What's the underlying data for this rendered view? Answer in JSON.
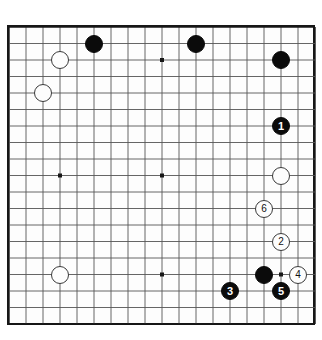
{
  "figure": {
    "name": "go-board-diagram",
    "board_size": 19,
    "visible_grid_lines": 19,
    "background_color": "#ffffff",
    "board_color": "#fdfdfd",
    "border_color": "#171717",
    "grid_line_color": "#555555",
    "black_stone_color": "#0b0b0b",
    "white_stone_color": "#fdfdfd",
    "white_stone_border_color": "#3a3a3a",
    "black_label_color": "#ffffff",
    "white_label_color": "#111111"
  },
  "geometry": {
    "origin_x": 9,
    "origin_y": 27,
    "step_x": 17,
    "step_y": 16.5,
    "columns": 18,
    "rows": 18,
    "stone_diameter": 18,
    "numbered_stone_diameter": 18,
    "star_point_radius": 2
  },
  "star_points": [
    {
      "name": "star-point-upper-left",
      "col": 3,
      "row": 2
    },
    {
      "name": "star-point-upper-center",
      "col": 9,
      "row": 2
    },
    {
      "name": "star-point-upper-right",
      "col": 16,
      "row": 2
    },
    {
      "name": "star-point-middle-left",
      "col": 3,
      "row": 9
    },
    {
      "name": "star-point-center",
      "col": 9,
      "row": 9
    },
    {
      "name": "star-point-middle-right",
      "col": 16,
      "row": 9
    },
    {
      "name": "star-point-lower-left",
      "col": 3,
      "row": 15
    },
    {
      "name": "star-point-lower-center",
      "col": 9,
      "row": 15
    },
    {
      "name": "star-point-lower-right",
      "col": 16,
      "row": 15
    }
  ],
  "stones": [
    {
      "name": "black-stone-upper-left-area",
      "color": "black",
      "label": "",
      "col": 5,
      "row": 1
    },
    {
      "name": "black-stone-upper-center",
      "color": "black",
      "label": "",
      "col": 11,
      "row": 1
    },
    {
      "name": "black-stone-upper-right",
      "color": "black",
      "label": "",
      "col": 16,
      "row": 2
    },
    {
      "name": "white-stone-upper-left-high",
      "color": "white",
      "label": "",
      "col": 3,
      "row": 2
    },
    {
      "name": "white-stone-upper-left-low",
      "color": "white",
      "label": "",
      "col": 2,
      "row": 4
    },
    {
      "name": "white-stone-right-side",
      "color": "white",
      "label": "",
      "col": 16,
      "row": 9
    },
    {
      "name": "white-stone-lower-left",
      "color": "white",
      "label": "",
      "col": 3,
      "row": 15
    },
    {
      "name": "black-stone-lower-right",
      "color": "black",
      "label": "",
      "col": 15,
      "row": 15
    },
    {
      "name": "numbered-stone-1",
      "color": "black",
      "label": "1",
      "col": 16,
      "row": 6
    },
    {
      "name": "numbered-stone-6",
      "color": "white",
      "label": "6",
      "col": 15,
      "row": 11
    },
    {
      "name": "numbered-stone-2",
      "color": "white",
      "label": "2",
      "col": 16,
      "row": 13
    },
    {
      "name": "numbered-stone-4",
      "color": "white",
      "label": "4",
      "col": 17,
      "row": 15
    },
    {
      "name": "numbered-stone-3",
      "color": "black",
      "label": "3",
      "col": 13,
      "row": 16
    },
    {
      "name": "numbered-stone-5",
      "color": "black",
      "label": "5",
      "col": 16,
      "row": 16
    }
  ],
  "move_sequence": [
    {
      "move": "1",
      "color": "black"
    },
    {
      "move": "2",
      "color": "white"
    },
    {
      "move": "3",
      "color": "black"
    },
    {
      "move": "4",
      "color": "white"
    },
    {
      "move": "5",
      "color": "black"
    },
    {
      "move": "6",
      "color": "white"
    }
  ]
}
